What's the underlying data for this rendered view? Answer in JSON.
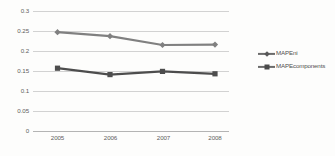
{
  "chart_data": {
    "type": "line",
    "title": "",
    "xlabel": "",
    "ylabel": "",
    "categories": [
      "2005",
      "2006",
      "2007",
      "2008"
    ],
    "series": [
      {
        "name": "MAPEni",
        "marker": "diamond",
        "color": "#808080",
        "values": [
          0.247,
          0.237,
          0.215,
          0.216
        ]
      },
      {
        "name": "MAPEcomponents",
        "marker": "square",
        "color": "#4d4d4d",
        "values": [
          0.157,
          0.141,
          0.149,
          0.143
        ]
      }
    ],
    "ylim": [
      0,
      0.35
    ],
    "ytick_labels": [
      "0.35",
      "0.3",
      "0.25",
      "0.2",
      "0.15",
      "0.1",
      "0.05",
      "0"
    ],
    "ytick_values": [
      0.35,
      0.3,
      0.25,
      0.2,
      0.15,
      0.1,
      0.05,
      0
    ],
    "grid": true,
    "legend_position": "right",
    "note_top_label_clipped": "0.35"
  },
  "axis": {
    "y": {
      "t0": "0.35",
      "t1": "0.3",
      "t2": "0.25",
      "t3": "0.2",
      "t4": "0.15",
      "t5": "0.1",
      "t6": "0.05",
      "t7": "0"
    },
    "x": {
      "t0": "2005",
      "t1": "2006",
      "t2": "2007",
      "t3": "2008"
    }
  },
  "legend": {
    "items": [
      {
        "label": "MAPEni"
      },
      {
        "label": "MAPEcomponents"
      }
    ]
  }
}
